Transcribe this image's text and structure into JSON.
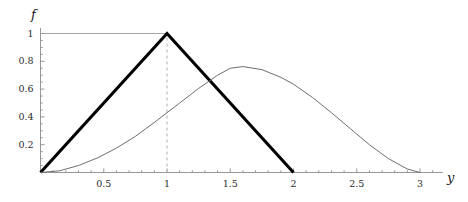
{
  "figure": {
    "background": "#ffffff",
    "axis_color": "#8c8c8c",
    "thick_curve_color": "#000000",
    "thin_curve_color": "#6e6e6e",
    "dashed_line_color": "#b0b0b0"
  },
  "axes": {
    "x_label": "y",
    "y_label": "f",
    "x_ticks": [
      "0.5",
      "1",
      "1.5",
      "2",
      "2.5",
      "3"
    ],
    "x_tick_values": [
      0.5,
      1,
      1.5,
      2,
      2.5,
      3
    ],
    "y_ticks": [
      "0.2",
      "0.4",
      "0.6",
      "0.8",
      "1"
    ],
    "y_tick_values": [
      0.2,
      0.4,
      0.6,
      0.8,
      1
    ]
  },
  "chart_data": {
    "type": "line",
    "title": "",
    "xlabel": "y",
    "ylabel": "f",
    "xlim": [
      0,
      3.15
    ],
    "ylim": [
      0,
      1.06
    ],
    "grid": false,
    "legend": null,
    "annotations": [
      {
        "name": "peak-guide-horizontal",
        "from": [
          0,
          1
        ],
        "to": [
          1,
          1
        ],
        "style": "solid-thin"
      },
      {
        "name": "peak-guide-vertical",
        "from": [
          1,
          0
        ],
        "to": [
          1,
          1
        ],
        "style": "dashed"
      }
    ],
    "series": [
      {
        "name": "triangular-density",
        "style": "thick",
        "color": "#000000",
        "x": [
          0,
          1,
          2
        ],
        "values": [
          0,
          1,
          0
        ]
      },
      {
        "name": "smooth-density",
        "style": "thin",
        "color": "#6e6e6e",
        "x": [
          0,
          0.15,
          0.3,
          0.45,
          0.6,
          0.75,
          0.9,
          1.0,
          1.1,
          1.25,
          1.4,
          1.5,
          1.6,
          1.75,
          1.9,
          2.0,
          2.15,
          2.3,
          2.45,
          2.6,
          2.75,
          2.9,
          3.0
        ],
        "values": [
          0,
          0.012,
          0.05,
          0.105,
          0.175,
          0.26,
          0.36,
          0.43,
          0.5,
          0.605,
          0.7,
          0.75,
          0.762,
          0.74,
          0.685,
          0.635,
          0.54,
          0.43,
          0.315,
          0.2,
          0.1,
          0.025,
          0
        ]
      }
    ]
  }
}
